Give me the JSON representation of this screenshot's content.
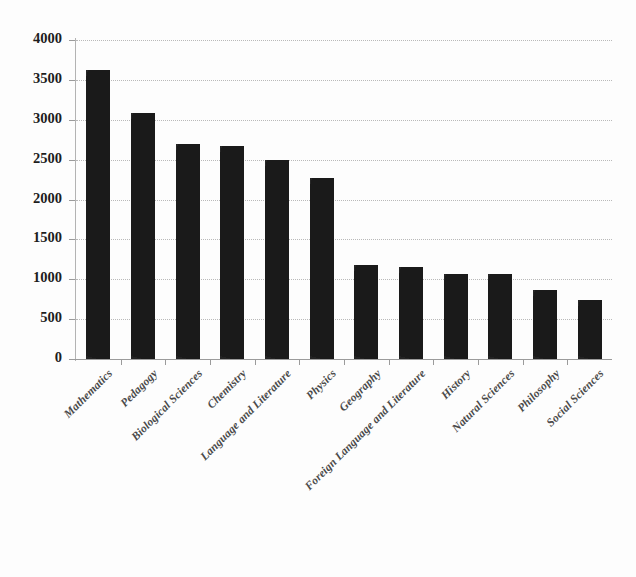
{
  "chart_data": {
    "type": "bar",
    "title": "",
    "subtitle": "",
    "xlabel": "",
    "ylabel": "",
    "ylim": [
      0,
      4000
    ],
    "ytick_step": 500,
    "yticks": [
      "0",
      "500",
      "1000",
      "1500",
      "2000",
      "2500",
      "3000",
      "3500",
      "4000"
    ],
    "grid": true,
    "grid_axis": "y",
    "grid_style": "dotted",
    "legend": false,
    "legend_position": "none",
    "bar_color": "#1a1a1a",
    "gridline_color": "#b9b9b9",
    "axis_color": "#9b9b9b",
    "label_color": "#4a4a4a",
    "xtick_rotation": -45,
    "categories": [
      "Mathematics",
      "Pedagogy",
      "Biological Sciences",
      "Chemistry",
      "Language and Literature",
      "Physics",
      "Geography",
      "Foreign Language and Literature",
      "History",
      "Natural Sciences",
      "Philosophy",
      "Social Sciences"
    ],
    "values": [
      3620,
      3080,
      2700,
      2670,
      2490,
      2270,
      1180,
      1155,
      1060,
      1060,
      870,
      735
    ]
  }
}
